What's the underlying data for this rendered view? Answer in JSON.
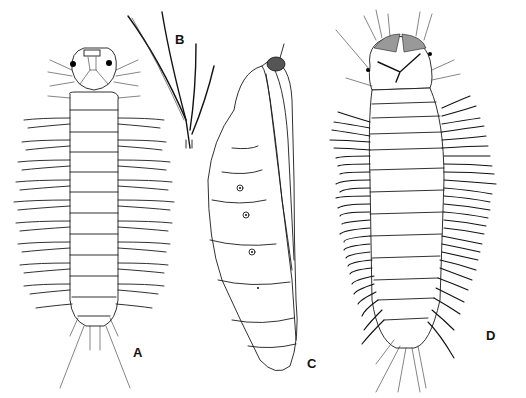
{
  "figure": {
    "type": "scientific-illustration",
    "panels": [
      {
        "id": "A",
        "label": "A",
        "subject": "larva, dorsal view with long lateral processes"
      },
      {
        "id": "B",
        "label": "B",
        "subject": "detail of branched lateral seta"
      },
      {
        "id": "C",
        "label": "C",
        "subject": "pupa, lateral view"
      },
      {
        "id": "D",
        "label": "D",
        "subject": "larva, dorsal view with dense dark lateral setae"
      }
    ]
  },
  "colors": {
    "ink": "#1a1a1a",
    "background": "#ffffff"
  }
}
